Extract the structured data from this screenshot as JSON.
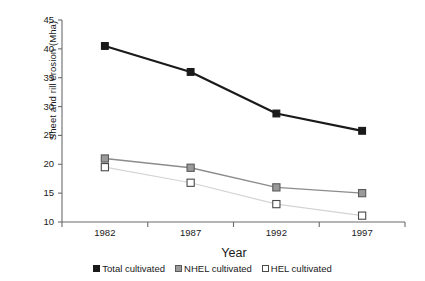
{
  "chart_data": {
    "type": "line",
    "title": "",
    "xlabel": "Year",
    "ylabel": "Sheet and rill erosion (Mha)",
    "categories": [
      "1982",
      "1987",
      "1992",
      "1997"
    ],
    "xtick_labels": [
      "1982",
      "1987",
      "1992",
      "1997"
    ],
    "ytick_labels": [
      "10",
      "15",
      "20",
      "25",
      "30",
      "35",
      "40",
      "45"
    ],
    "ylim": [
      10,
      45
    ],
    "ytick_step": 5,
    "grid": false,
    "legend_position": "bottom",
    "series": [
      {
        "name": "Total cultivated",
        "values": [
          40.5,
          36.0,
          28.8,
          25.8
        ],
        "color": "#1a1a1a",
        "marker": "filled-square",
        "marker_fill": "#1a1a1a",
        "marker_edge": "#1a1a1a",
        "line_width": 2.2
      },
      {
        "name": "NHEL cultivated",
        "values": [
          21.0,
          19.4,
          16.0,
          15.0
        ],
        "color": "#8c8c8c",
        "marker": "gray-square",
        "marker_fill": "#9a9a9a",
        "marker_edge": "#5a5a5a",
        "line_width": 1.4
      },
      {
        "name": "HEL cultivated",
        "values": [
          19.5,
          16.8,
          13.1,
          11.1
        ],
        "color": "#d4d4d4",
        "marker": "open-square",
        "marker_fill": "#ffffff",
        "marker_edge": "#4a4a4a",
        "line_width": 1.2
      }
    ]
  },
  "legend": {
    "items": [
      {
        "label": "Total cultivated",
        "swatch": "filled-black-square"
      },
      {
        "label": "NHEL cultivated",
        "swatch": "filled-gray-square"
      },
      {
        "label": "HEL cultivated",
        "swatch": "open-white-square"
      }
    ]
  },
  "axes": {
    "x_axis_label": "Year",
    "y_axis_label": "Sheet and rill erosion (Mha)"
  },
  "colors": {
    "total": "#1a1a1a",
    "nhel": "#8c8c8c",
    "hel": "#d4d4d4",
    "axis": "#6b6b6b",
    "background": "#ffffff"
  }
}
